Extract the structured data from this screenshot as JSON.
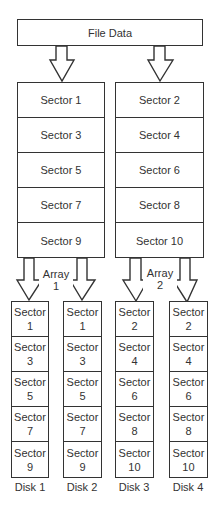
{
  "file_data": {
    "label": "File Data"
  },
  "sector_columns": [
    {
      "sectors": [
        "Sector 1",
        "Sector 3",
        "Sector 5",
        "Sector 7",
        "Sector 9"
      ]
    },
    {
      "sectors": [
        "Sector 2",
        "Sector 4",
        "Sector 6",
        "Sector 8",
        "Sector 10"
      ]
    }
  ],
  "arrays": [
    {
      "word": "Array",
      "number": "1"
    },
    {
      "word": "Array",
      "number": "2"
    }
  ],
  "disks": [
    {
      "name": "Disk 1",
      "sectors": [
        "Sector 1",
        "Sector 3",
        "Sector 5",
        "Sector 7",
        "Sector 9"
      ]
    },
    {
      "name": "Disk 2",
      "sectors": [
        "Sector 1",
        "Sector 3",
        "Sector 5",
        "Sector 7",
        "Sector 9"
      ]
    },
    {
      "name": "Disk 3",
      "sectors": [
        "Sector 2",
        "Sector 4",
        "Sector 6",
        "Sector 8",
        "Sector 10"
      ]
    },
    {
      "name": "Disk 4",
      "sectors": [
        "Sector 2",
        "Sector 4",
        "Sector 6",
        "Sector 8",
        "Sector 10"
      ]
    }
  ],
  "colors": {
    "line": "#333333",
    "text": "#333333",
    "background": "#ffffff"
  }
}
